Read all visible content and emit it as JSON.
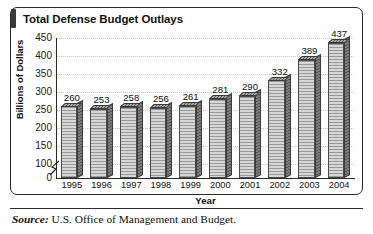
{
  "figure": {
    "title": "Total Defense Budget Outlays",
    "source_label": "Source:",
    "source_text": "U.S. Office of Management and Budget."
  },
  "chart_data": {
    "type": "bar",
    "title": "Total Defense Budget Outlays",
    "xlabel": "Year",
    "ylabel": "Billions of Dollars",
    "categories": [
      "1995",
      "1996",
      "1997",
      "1998",
      "1999",
      "2000",
      "2001",
      "2002",
      "2003",
      "2004"
    ],
    "values": [
      260,
      253,
      258,
      256,
      261,
      281,
      290,
      332,
      389,
      437
    ],
    "value_labels": [
      "260",
      "253",
      "258",
      "256",
      "261",
      "281",
      "290",
      "332",
      "389",
      "437"
    ],
    "ylim": [
      0,
      450
    ],
    "yticks": [
      0,
      100,
      150,
      200,
      250,
      300,
      350,
      400,
      450
    ],
    "ytick_labels": [
      "0",
      "100",
      "150",
      "200",
      "250",
      "300",
      "350",
      "400",
      "450"
    ],
    "axis_break": true,
    "axis_break_between": [
      0,
      100
    ],
    "grid": true,
    "grid_axis": "y",
    "legend": false,
    "bar_style": "3d-hatched",
    "colors": {
      "bar_front": "#b9b9b9",
      "bar_side": "#6e6e6e",
      "bar_top": "#8c8c8c",
      "axis": "#2b2b2b",
      "grid": "#c9c9c9",
      "text": "#111111",
      "background": "#ffffff"
    }
  }
}
